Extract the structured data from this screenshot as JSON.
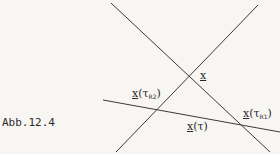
{
  "figure": {
    "caption": "Abb.12.4",
    "line_color": "#3a3a3a",
    "background": "#f7f6f3"
  },
  "labels": {
    "x": {
      "var": "x"
    },
    "x_tauR2": {
      "var": "x",
      "open": "(",
      "tau": "τ",
      "sub": "R2",
      "close": ")"
    },
    "x_tauR1": {
      "var": "x",
      "open": "(",
      "tau": "τ",
      "sub": "R1",
      "close": ")"
    },
    "x_tau": {
      "var": "x",
      "open": "(",
      "tau": "τ",
      "close": ")"
    }
  },
  "lines": [
    {
      "name": "descending-line",
      "x1": 111,
      "y1": 3,
      "x2": 270,
      "y2": 152
    },
    {
      "name": "ascending-line",
      "x1": 258,
      "y1": 5,
      "x2": 116,
      "y2": 152
    },
    {
      "name": "shallow-line",
      "x1": 103,
      "y1": 100,
      "x2": 280,
      "y2": 132
    }
  ]
}
